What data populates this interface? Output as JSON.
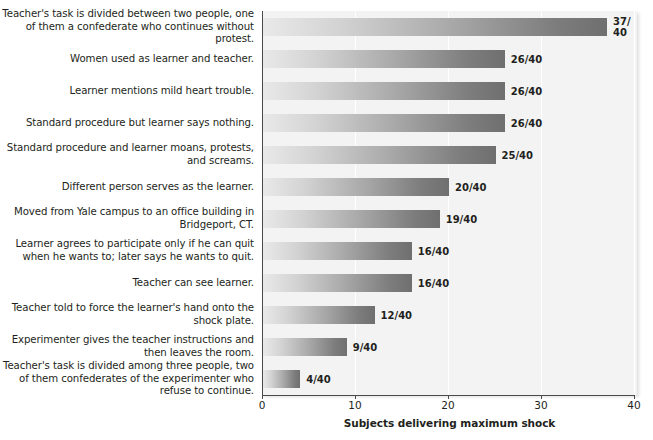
{
  "chart_data": {
    "type": "bar",
    "orientation": "horizontal",
    "title": "",
    "xlabel": "Subjects delivering maximum shock",
    "ylabel": "",
    "xlim": [
      0,
      40
    ],
    "xticks": [
      0,
      10,
      20,
      30,
      40
    ],
    "xtick_labels": [
      "0",
      "10",
      "20",
      "30",
      "40"
    ],
    "grid": true,
    "grid_axis": "x",
    "legend": false,
    "denominator": 40,
    "categories": [
      "Teacher's task is divided between two people, one of them a confederate who continues without protest.",
      "Women used as learner and teacher.",
      "Learner mentions mild heart trouble.",
      "Standard procedure but learner says nothing.",
      "Standard procedure and learner moans, protests, and screams.",
      "Different person serves as the learner.",
      "Moved from Yale campus to an office building in Bridgeport, CT.",
      "Learner agrees to participate only if he can quit when he wants to; later says he wants to quit.",
      "Teacher can see learner.",
      "Teacher told to force the learner's hand onto the shock plate.",
      "Experimenter gives the teacher instructions and then leaves the room.",
      "Teacher's task is divided among three people, two of them confederates of the experimenter who refuse to continue."
    ],
    "values": [
      37,
      26,
      26,
      26,
      25,
      20,
      19,
      16,
      16,
      12,
      9,
      4
    ],
    "value_labels": [
      "37/\n40",
      "26/40",
      "26/40",
      "26/40",
      "25/40",
      "20/40",
      "19/40",
      "16/40",
      "16/40",
      "12/40",
      "9/40",
      "4/40"
    ]
  },
  "colors": {
    "plot_background": "#f3f3f3",
    "gridline": "#ffffff",
    "axis": "#4a4a4a",
    "bar_gradient_start": "#e9e9e9",
    "bar_gradient_end": "#6f6f6f",
    "text": "#231f20",
    "page_background": "#ffffff"
  }
}
